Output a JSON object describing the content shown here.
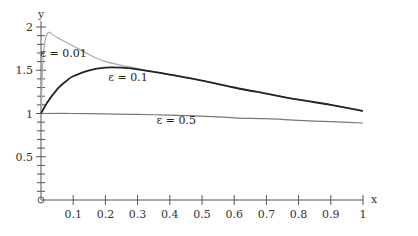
{
  "chart_data": {
    "type": "line",
    "title": "",
    "xlabel": "x",
    "ylabel": "y",
    "xlim": [
      0,
      1
    ],
    "ylim": [
      0,
      2
    ],
    "grid": false,
    "legend_position": "inline-annotations",
    "x_ticks": [
      "0.1",
      "0.2",
      "0.3",
      "0.4",
      "0.5",
      "0.6",
      "0.7",
      "0.8",
      "0.9",
      "1"
    ],
    "y_ticks": [
      "0.5",
      "1",
      "1.5",
      "2"
    ],
    "series": [
      {
        "name": "ε = 0.01",
        "color": "#aaaaaa",
        "x": [
          0,
          0.005,
          0.01,
          0.015,
          0.02,
          0.025,
          0.03,
          0.05,
          0.1,
          0.15,
          0.2,
          0.3,
          0.4,
          0.5,
          0.6,
          0.7,
          0.8,
          0.9,
          1.0
        ],
        "y": [
          1.0,
          1.55,
          1.78,
          1.88,
          1.92,
          1.94,
          1.93,
          1.88,
          1.78,
          1.68,
          1.6,
          1.52,
          1.45,
          1.38,
          1.3,
          1.23,
          1.16,
          1.1,
          1.03
        ]
      },
      {
        "name": "ε = 0.1",
        "color": "#222222",
        "x": [
          0,
          0.02,
          0.05,
          0.08,
          0.1,
          0.15,
          0.2,
          0.25,
          0.3,
          0.4,
          0.5,
          0.6,
          0.7,
          0.8,
          0.9,
          1.0
        ],
        "y": [
          1.0,
          1.13,
          1.28,
          1.38,
          1.43,
          1.5,
          1.53,
          1.53,
          1.51,
          1.45,
          1.38,
          1.3,
          1.23,
          1.16,
          1.1,
          1.03
        ]
      },
      {
        "name": "ε = 0.5",
        "color": "#777777",
        "x": [
          0,
          0.1,
          0.2,
          0.3,
          0.4,
          0.5,
          0.6,
          0.7,
          0.8,
          0.9,
          1.0
        ],
        "y": [
          1.0,
          1.0,
          0.995,
          0.99,
          0.98,
          0.97,
          0.95,
          0.94,
          0.92,
          0.905,
          0.89
        ]
      }
    ],
    "annotations": [
      {
        "text": "ε = 0.01",
        "x": 0.07,
        "y": 1.7
      },
      {
        "text": "ε = 0.1",
        "x": 0.27,
        "y": 1.42
      },
      {
        "text": "ε = 0.5",
        "x": 0.42,
        "y": 0.92
      }
    ],
    "origin_marker": "o"
  }
}
